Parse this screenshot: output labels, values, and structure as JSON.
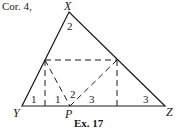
{
  "header": {
    "text": "Cor. 4,"
  },
  "vertices": {
    "X": "X",
    "Y": "Y",
    "Z": "Z",
    "P": "P"
  },
  "angles": {
    "apex": "2",
    "left_outer": "1",
    "left_inner": "1",
    "mid_left": "2",
    "mid_right": "3",
    "right": "3"
  },
  "caption": "Ex. 17",
  "colors": {
    "line": "#1a1a1a",
    "background": "#ffffff"
  }
}
